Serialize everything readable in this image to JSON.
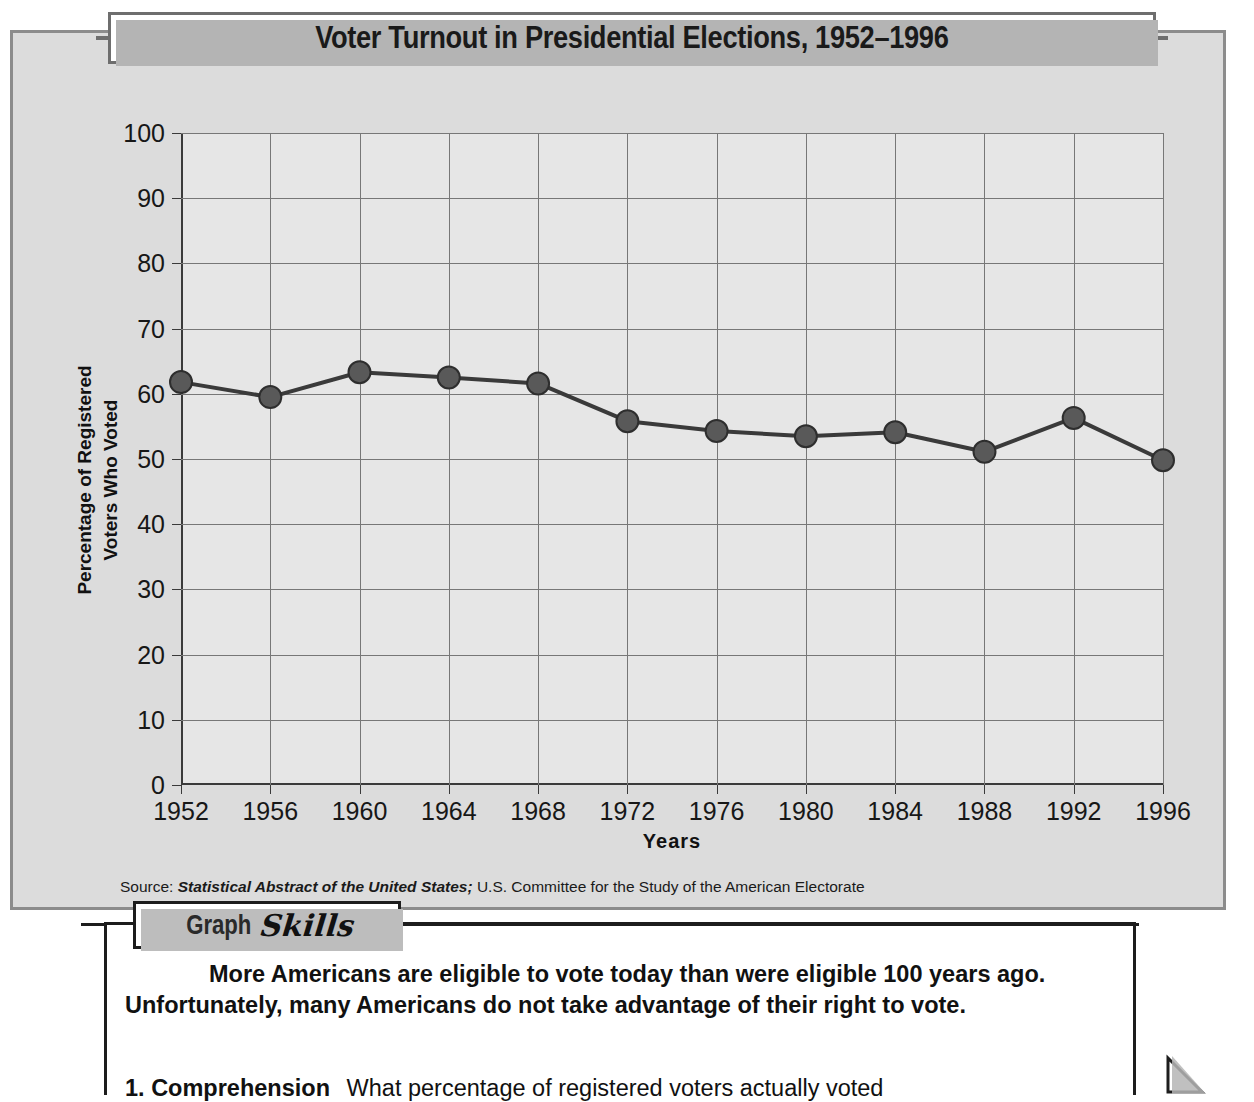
{
  "title": "Voter Turnout in Presidential Elections, 1952–1996",
  "axis": {
    "x_title": "Years",
    "y_title_line1": "Percentage of Registered",
    "y_title_line2": "Voters Who Voted"
  },
  "source": {
    "label": "Source:",
    "italic_part": "Statistical Abstract of the United States;",
    "rest": "U.S. Committee for the Study of the American Electorate"
  },
  "skills": {
    "tab_word1": "Graph",
    "tab_word2": "Skills",
    "body": "More Americans are eligible to vote today than were eligible 100 years ago. Unfortunately, many Americans do not take advantage of their right to vote.",
    "question_number": "1.",
    "question_term": "Comprehension",
    "question_text": "What percentage of registered voters actually voted"
  },
  "chart_data": {
    "type": "line",
    "title": "Voter Turnout in Presidential Elections, 1952–1996",
    "xlabel": "Years",
    "ylabel": "Percentage of Registered Voters Who Voted",
    "xlim": [
      1952,
      1996
    ],
    "ylim": [
      0,
      100
    ],
    "ytick_step": 10,
    "grid": true,
    "legend": "none",
    "marker": "circle",
    "line_color": "#3a3a3a",
    "marker_color": "#595959",
    "plot_background": "#e6e6e6",
    "categories": [
      1952,
      1956,
      1960,
      1964,
      1968,
      1972,
      1976,
      1980,
      1984,
      1988,
      1992,
      1996
    ],
    "xtick_labels": [
      "1952",
      "1956",
      "1960",
      "1964",
      "1968",
      "1972",
      "1976",
      "1980",
      "1984",
      "1988",
      "1992",
      "1996"
    ],
    "ytick_labels": [
      "0",
      "10",
      "20",
      "30",
      "40",
      "50",
      "60",
      "70",
      "80",
      "90",
      "100"
    ],
    "values": [
      61.8,
      59.5,
      63.3,
      62.5,
      61.6,
      55.8,
      54.3,
      53.5,
      54.1,
      51.1,
      56.3,
      49.8
    ]
  }
}
